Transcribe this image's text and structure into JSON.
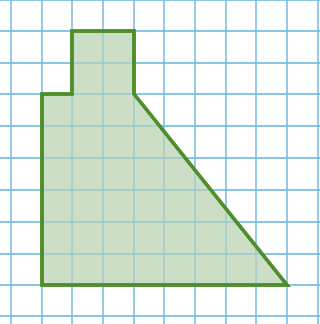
{
  "diagram": {
    "type": "grid-polygon",
    "colors": {
      "background": "#ffffff",
      "grid_line": "#6fb8de",
      "shape_fill": "#c4d8bd",
      "shape_stroke": "#4e8f2c"
    },
    "grid": {
      "x_lines": [
        11,
        42,
        72,
        103,
        134,
        164,
        195,
        226,
        256,
        287,
        318
      ],
      "y_lines": [
        0,
        31,
        63,
        94,
        126,
        158,
        190,
        222,
        254,
        285,
        316
      ]
    },
    "shape": {
      "grid_vertices": [
        [
          2,
          1
        ],
        [
          4,
          1
        ],
        [
          4,
          3
        ],
        [
          9,
          9
        ],
        [
          1,
          9
        ],
        [
          1,
          3
        ],
        [
          2,
          3
        ]
      ],
      "pixel_points": [
        [
          72,
          31
        ],
        [
          134,
          31
        ],
        [
          134,
          94
        ],
        [
          287,
          285
        ],
        [
          42,
          285
        ],
        [
          42,
          94
        ],
        [
          72,
          94
        ]
      ],
      "stroke_width": 3.5
    }
  }
}
